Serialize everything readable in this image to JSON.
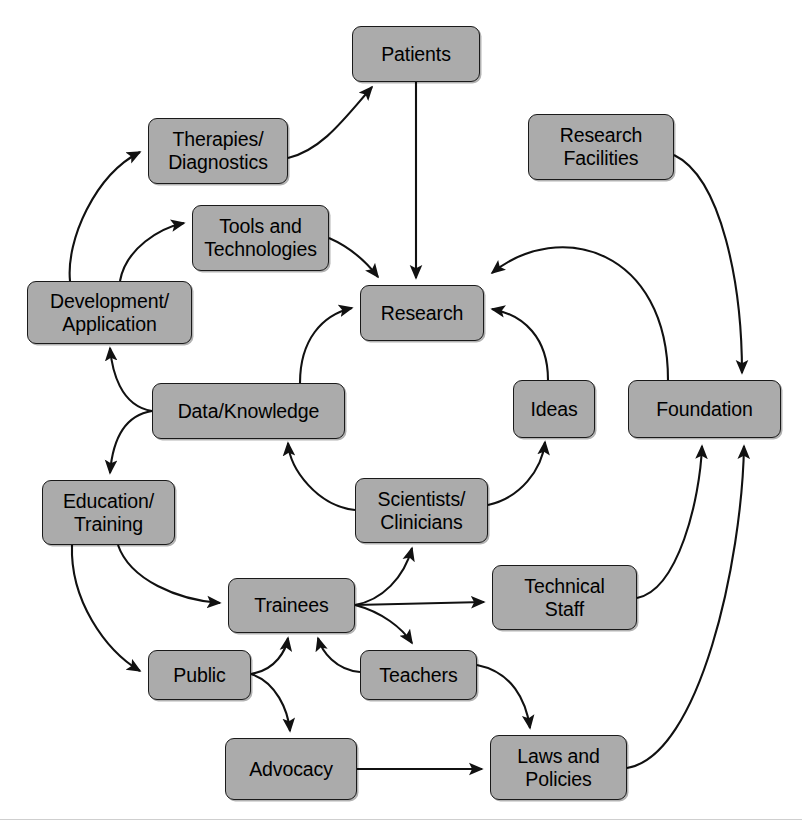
{
  "diagram": {
    "style": {
      "box_fill": "#ababab",
      "box_border": "#1a1a1a",
      "edge_color": "#111111",
      "background": "#ffffff",
      "text_color": "#000000"
    },
    "nodes": [
      {
        "id": "patients",
        "label": "Patients",
        "x": 352,
        "y": 26,
        "w": 128,
        "h": 56
      },
      {
        "id": "therapies",
        "label": "Therapies/\nDiagnostics",
        "x": 148,
        "y": 118,
        "w": 140,
        "h": 66
      },
      {
        "id": "research_facilities",
        "label": "Research\nFacilities",
        "x": 528,
        "y": 114,
        "w": 146,
        "h": 66
      },
      {
        "id": "tools",
        "label": "Tools and\nTechnologies",
        "x": 192,
        "y": 205,
        "w": 137,
        "h": 66
      },
      {
        "id": "development",
        "label": "Development/\nApplication",
        "x": 27,
        "y": 281,
        "w": 165,
        "h": 63
      },
      {
        "id": "research",
        "label": "Research",
        "x": 360,
        "y": 285,
        "w": 124,
        "h": 56
      },
      {
        "id": "data_knowledge",
        "label": "Data/Knowledge",
        "x": 152,
        "y": 383,
        "w": 193,
        "h": 56
      },
      {
        "id": "ideas",
        "label": "Ideas",
        "x": 513,
        "y": 380,
        "w": 82,
        "h": 58
      },
      {
        "id": "foundation",
        "label": "Foundation",
        "x": 628,
        "y": 380,
        "w": 153,
        "h": 58
      },
      {
        "id": "education",
        "label": "Education/\nTraining",
        "x": 42,
        "y": 480,
        "w": 133,
        "h": 65
      },
      {
        "id": "scientists",
        "label": "Scientists/\nClinicians",
        "x": 355,
        "y": 478,
        "w": 133,
        "h": 65
      },
      {
        "id": "trainees",
        "label": "Trainees",
        "x": 228,
        "y": 578,
        "w": 127,
        "h": 55
      },
      {
        "id": "technical_staff",
        "label": "Technical\nStaff",
        "x": 492,
        "y": 565,
        "w": 145,
        "h": 65
      },
      {
        "id": "public",
        "label": "Public",
        "x": 148,
        "y": 650,
        "w": 103,
        "h": 50
      },
      {
        "id": "teachers",
        "label": "Teachers",
        "x": 360,
        "y": 650,
        "w": 117,
        "h": 50
      },
      {
        "id": "advocacy",
        "label": "Advocacy",
        "x": 225,
        "y": 738,
        "w": 132,
        "h": 62
      },
      {
        "id": "laws",
        "label": "Laws and\nPolicies",
        "x": 490,
        "y": 735,
        "w": 137,
        "h": 65
      }
    ],
    "edges": [
      {
        "from": "development",
        "to": "therapies",
        "d": "M 70 281 C 66 240 95 175 140 152",
        "arrow": true
      },
      {
        "from": "development",
        "to": "tools",
        "d": "M 120 281 C 126 248 160 228 184 223",
        "arrow": true
      },
      {
        "from": "therapies",
        "to": "patients",
        "d": "M 288 158 C 322 150 345 118 372 87",
        "arrow": true
      },
      {
        "from": "patients",
        "to": "research",
        "d": "M 416 82 L 416 278",
        "arrow": true
      },
      {
        "from": "tools",
        "to": "research",
        "d": "M 329 238 C 352 248 368 264 378 277",
        "arrow": true
      },
      {
        "from": "data_knowledge",
        "to": "research",
        "d": "M 300 383 C 300 340 322 315 352 308",
        "arrow": true
      },
      {
        "from": "ideas",
        "to": "research",
        "d": "M 548 380 C 548 338 524 315 492 309",
        "arrow": true
      },
      {
        "from": "foundation",
        "to": "research",
        "d": "M 668 380 C 668 250 560 218 492 273",
        "arrow": true
      },
      {
        "from": "research_facilities",
        "to": "foundation",
        "d": "M 674 155 C 722 178 742 286 742 373",
        "arrow": true
      },
      {
        "from": "data_knowledge",
        "to": "development",
        "d": "M 152 411 C 120 406 112 370 110 348",
        "arrow": true
      },
      {
        "from": "data_knowledge",
        "to": "education",
        "d": "M 152 411 C 120 416 112 448 110 473",
        "arrow": true
      },
      {
        "from": "scientists",
        "to": "data_knowledge",
        "d": "M 355 510 C 318 506 290 470 288 443",
        "arrow": true
      },
      {
        "from": "scientists",
        "to": "ideas",
        "d": "M 488 505 C 520 498 542 470 545 442",
        "arrow": true
      },
      {
        "from": "education",
        "to": "trainees",
        "d": "M 118 545 C 130 580 178 600 220 603",
        "arrow": true
      },
      {
        "from": "education",
        "to": "public",
        "d": "M 72 545 C 70 600 105 650 140 671",
        "arrow": true
      },
      {
        "from": "trainees",
        "to": "scientists",
        "d": "M 355 605 C 382 600 404 578 412 548",
        "arrow": true
      },
      {
        "from": "trainees",
        "to": "technical_staff",
        "d": "M 355 605 L 484 602",
        "arrow": true
      },
      {
        "from": "trainees",
        "to": "teachers",
        "d": "M 355 605 C 382 612 402 628 412 643",
        "arrow": true
      },
      {
        "from": "public",
        "to": "trainees",
        "d": "M 251 674 C 276 670 286 650 288 638",
        "arrow": true
      },
      {
        "from": "public",
        "to": "advocacy",
        "d": "M 251 674 C 276 682 288 710 290 731",
        "arrow": true
      },
      {
        "from": "teachers",
        "to": "trainees",
        "d": "M 360 672 C 336 670 322 652 318 638",
        "arrow": true
      },
      {
        "from": "teachers",
        "to": "laws",
        "d": "M 477 665 C 512 672 526 700 530 728",
        "arrow": true
      },
      {
        "from": "advocacy",
        "to": "laws",
        "d": "M 357 769 L 482 769",
        "arrow": true
      },
      {
        "from": "technical_staff",
        "to": "foundation",
        "d": "M 637 598 C 678 590 700 500 702 446",
        "arrow": true
      },
      {
        "from": "laws",
        "to": "foundation",
        "d": "M 627 768 C 700 756 742 560 744 446",
        "arrow": true
      }
    ]
  }
}
